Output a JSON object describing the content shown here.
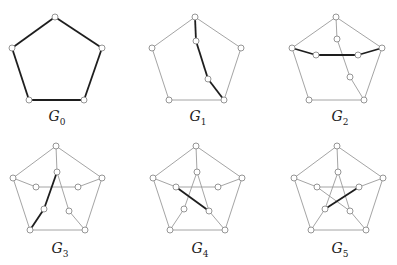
{
  "figure": {
    "colors": {
      "thin_edge": "#9a9a9a",
      "bold_edge": "#1e1e1e",
      "vertex_fill": "#ffffff",
      "vertex_stroke": "#8a8a8a"
    },
    "vertex_radius": 3,
    "panels": [
      {
        "name": "G",
        "sub": "0",
        "label_pos": [
          57,
          118
        ],
        "vertices": {
          "o0": [
            55,
            17
          ],
          "o1": [
            102,
            48
          ],
          "o2": [
            84,
            100
          ],
          "o3": [
            29,
            100
          ],
          "o4": [
            12,
            48
          ]
        },
        "thin": [],
        "bold": [
          [
            "o0",
            "o1"
          ],
          [
            "o1",
            "o2"
          ],
          [
            "o2",
            "o3"
          ],
          [
            "o3",
            "o4"
          ],
          [
            "o4",
            "o0"
          ]
        ]
      },
      {
        "name": "G",
        "sub": "1",
        "label_pos": [
          198,
          118
        ],
        "vertices": {
          "o0": [
            195,
            17
          ],
          "o1": [
            241,
            48
          ],
          "o2": [
            224,
            100
          ],
          "o3": [
            169,
            100
          ],
          "o4": [
            152,
            48
          ],
          "i0": [
            196,
            41
          ],
          "i2": [
            208,
            79
          ]
        },
        "thin": [
          [
            "o0",
            "o1"
          ],
          [
            "o1",
            "o2"
          ],
          [
            "o2",
            "o3"
          ],
          [
            "o3",
            "o4"
          ],
          [
            "o4",
            "o0"
          ]
        ],
        "bold": [
          [
            "o0",
            "i0"
          ],
          [
            "i0",
            "i2"
          ],
          [
            "i2",
            "o2"
          ]
        ]
      },
      {
        "name": "G",
        "sub": "2",
        "label_pos": [
          340,
          118
        ],
        "vertices": {
          "o0": [
            336,
            17
          ],
          "o1": [
            382,
            48
          ],
          "o2": [
            364,
            100
          ],
          "o3": [
            309,
            100
          ],
          "o4": [
            292,
            48
          ],
          "i0": [
            337,
            39
          ],
          "i1": [
            358,
            55
          ],
          "i2": [
            350,
            77
          ],
          "i4": [
            316,
            55
          ]
        },
        "thin": [
          [
            "o0",
            "o1"
          ],
          [
            "o1",
            "o2"
          ],
          [
            "o2",
            "o3"
          ],
          [
            "o3",
            "o4"
          ],
          [
            "o4",
            "o0"
          ],
          [
            "o0",
            "i0"
          ],
          [
            "i0",
            "i2"
          ],
          [
            "i2",
            "o2"
          ]
        ],
        "bold": [
          [
            "o4",
            "i4"
          ],
          [
            "i4",
            "i1"
          ],
          [
            "i1",
            "o1"
          ]
        ]
      },
      {
        "name": "G",
        "sub": "3",
        "label_pos": [
          60,
          250
        ],
        "vertices": {
          "o0": [
            56,
            146
          ],
          "o1": [
            102,
            178
          ],
          "o2": [
            85,
            230
          ],
          "o3": [
            30,
            230
          ],
          "o4": [
            13,
            178
          ],
          "i0": [
            57,
            172
          ],
          "i1": [
            78,
            187
          ],
          "i2": [
            69,
            211
          ],
          "i3": [
            44,
            209
          ],
          "i4": [
            36,
            187
          ]
        },
        "thin": [
          [
            "o0",
            "o1"
          ],
          [
            "o1",
            "o2"
          ],
          [
            "o2",
            "o3"
          ],
          [
            "o3",
            "o4"
          ],
          [
            "o4",
            "o0"
          ],
          [
            "o0",
            "i0"
          ],
          [
            "i0",
            "i2"
          ],
          [
            "i2",
            "o2"
          ],
          [
            "o4",
            "i4"
          ],
          [
            "i4",
            "i1"
          ],
          [
            "i1",
            "o1"
          ]
        ],
        "bold": [
          [
            "i0",
            "i3"
          ],
          [
            "i3",
            "o3"
          ]
        ]
      },
      {
        "name": "G",
        "sub": "4",
        "label_pos": [
          200,
          250
        ],
        "vertices": {
          "o0": [
            196,
            146
          ],
          "o1": [
            242,
            178
          ],
          "o2": [
            225,
            230
          ],
          "o3": [
            170,
            230
          ],
          "o4": [
            153,
            178
          ],
          "i0": [
            197,
            172
          ],
          "i1": [
            218,
            187
          ],
          "i2": [
            209,
            211
          ],
          "i3": [
            184,
            209
          ],
          "i4": [
            176,
            187
          ]
        },
        "thin": [
          [
            "o0",
            "o1"
          ],
          [
            "o1",
            "o2"
          ],
          [
            "o2",
            "o3"
          ],
          [
            "o3",
            "o4"
          ],
          [
            "o4",
            "o0"
          ],
          [
            "o0",
            "i0"
          ],
          [
            "i0",
            "i2"
          ],
          [
            "i2",
            "o2"
          ],
          [
            "o4",
            "i4"
          ],
          [
            "i4",
            "i1"
          ],
          [
            "i1",
            "o1"
          ],
          [
            "i0",
            "i3"
          ],
          [
            "i3",
            "o3"
          ]
        ],
        "bold": [
          [
            "i4",
            "i2"
          ]
        ]
      },
      {
        "name": "G",
        "sub": "5",
        "label_pos": [
          340,
          250
        ],
        "vertices": {
          "o0": [
            337,
            146
          ],
          "o1": [
            383,
            178
          ],
          "o2": [
            366,
            230
          ],
          "o3": [
            311,
            230
          ],
          "o4": [
            294,
            178
          ],
          "i0": [
            338,
            172
          ],
          "i1": [
            359,
            187
          ],
          "i2": [
            350,
            211
          ],
          "i3": [
            325,
            209
          ],
          "i4": [
            317,
            187
          ]
        },
        "thin": [
          [
            "o0",
            "o1"
          ],
          [
            "o1",
            "o2"
          ],
          [
            "o2",
            "o3"
          ],
          [
            "o3",
            "o4"
          ],
          [
            "o4",
            "o0"
          ],
          [
            "o0",
            "i0"
          ],
          [
            "i0",
            "i2"
          ],
          [
            "i2",
            "o2"
          ],
          [
            "o4",
            "i4"
          ],
          [
            "i4",
            "i1"
          ],
          [
            "i1",
            "o1"
          ],
          [
            "i0",
            "i3"
          ],
          [
            "i3",
            "o3"
          ],
          [
            "i4",
            "i2"
          ]
        ],
        "bold": [
          [
            "i1",
            "i3"
          ]
        ]
      }
    ]
  }
}
